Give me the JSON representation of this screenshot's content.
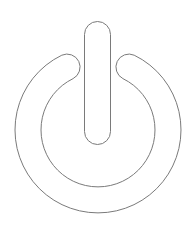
{
  "icon": {
    "name": "power-icon",
    "label": "Power",
    "stroke_color": "#7a7a7a",
    "fill_color": "#ffffff",
    "background": "#ffffff"
  }
}
